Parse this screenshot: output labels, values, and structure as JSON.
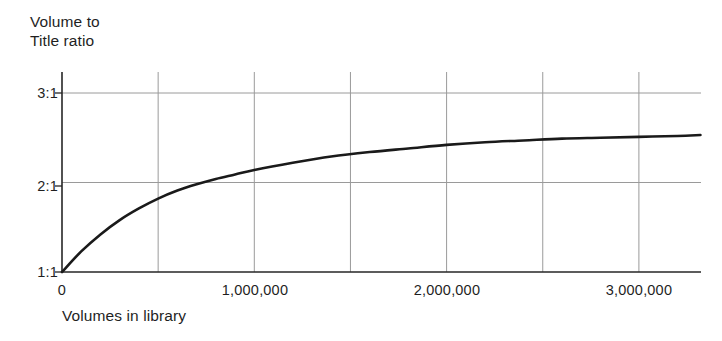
{
  "chart_data": {
    "type": "line",
    "title": "",
    "ylabel": "Volume to\nTitle ratio",
    "xlabel": "Volumes in library",
    "xlim": [
      0,
      3320000
    ],
    "ylim": [
      1,
      3.2
    ],
    "grid": true,
    "legend": null,
    "xticks": [
      0,
      1000000,
      2000000,
      3000000
    ],
    "xtick_labels": [
      "0",
      "1,000,000",
      "2,000,000",
      "3,000,000"
    ],
    "yticks": [
      1,
      2,
      3
    ],
    "ytick_labels": [
      "1:1",
      "2:1",
      "3:1"
    ],
    "gridlines_x": [
      500000,
      1000000,
      1500000,
      2000000,
      2500000,
      3000000
    ],
    "gridlines_y": [
      2,
      3
    ],
    "line_color": "#1a1a1a",
    "axis_color": "#262626",
    "grid_color": "#9a9a9a",
    "series": [
      {
        "name": "Volume to title ratio",
        "x": [
          0,
          100000,
          200000,
          300000,
          400000,
          500000,
          600000,
          700000,
          800000,
          900000,
          1000000,
          1200000,
          1400000,
          1600000,
          1800000,
          2000000,
          2200000,
          2400000,
          2600000,
          2800000,
          3000000,
          3200000,
          3320000
        ],
        "y": [
          1.0,
          1.23,
          1.42,
          1.58,
          1.71,
          1.82,
          1.91,
          1.98,
          2.04,
          2.09,
          2.14,
          2.22,
          2.29,
          2.34,
          2.38,
          2.42,
          2.45,
          2.47,
          2.49,
          2.5,
          2.51,
          2.52,
          2.53
        ]
      }
    ]
  },
  "axes": {
    "y_title": "Volume to\nTitle ratio",
    "x_title": "Volumes in library",
    "ytick_1": "1:1",
    "ytick_2": "2:1",
    "ytick_3": "3:1",
    "xtick_0": "0",
    "xtick_1": "1,000,000",
    "xtick_2": "2,000,000",
    "xtick_3": "3,000,000"
  }
}
